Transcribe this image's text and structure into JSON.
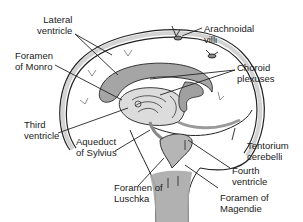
{
  "diagram": {
    "colors": {
      "outline": "#222222",
      "csf_fill": "#9a9a9a",
      "csf_light": "#c8c8c8",
      "background": "#ffffff",
      "text": "#1a1a1a"
    },
    "labels": [
      {
        "id": "lateral-ventricle",
        "lines": [
          "Lateral",
          "ventricle"
        ]
      },
      {
        "id": "foramen-of-monro",
        "lines": [
          "Foramen",
          "of Monro"
        ]
      },
      {
        "id": "arachnoidal-villi",
        "lines": [
          "Arachnoidal",
          "villi"
        ]
      },
      {
        "id": "choroid-plexuses",
        "lines": [
          "Choroid",
          "plexuses"
        ]
      },
      {
        "id": "third-ventricle",
        "lines": [
          "Third",
          "ventricle"
        ]
      },
      {
        "id": "aqueduct-of-sylvius",
        "lines": [
          "Aqueduct",
          "of Sylvius"
        ]
      },
      {
        "id": "tentorium-cerebelli",
        "lines": [
          "Tentorium",
          "cerebelli"
        ]
      },
      {
        "id": "fourth-ventricle",
        "lines": [
          "Fourth",
          "ventricle"
        ]
      },
      {
        "id": "foramen-of-luschka",
        "lines": [
          "Foramen of",
          "Luschka"
        ]
      },
      {
        "id": "foramen-of-magendie",
        "lines": [
          "Foramen of",
          "Magendie"
        ]
      }
    ]
  }
}
